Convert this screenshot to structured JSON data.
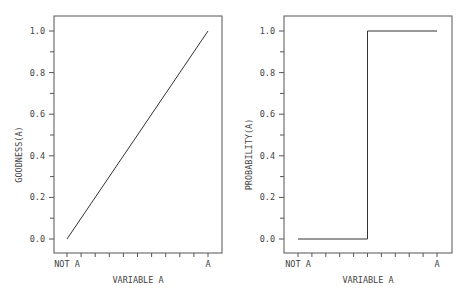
{
  "chart_data": [
    {
      "type": "line",
      "title": "",
      "xlabel": "VARIABLE A",
      "ylabel": "GOODNESS(A)",
      "x_tick_labels": {
        "start": "NOT A",
        "end": "A"
      },
      "x_minor_ticks": 11,
      "y_ticks": [
        "0.0",
        "0.2",
        "0.4",
        "0.6",
        "0.8",
        "1.0"
      ],
      "ylim": [
        0,
        1
      ],
      "grid": false,
      "series": [
        {
          "name": "goodness",
          "x": [
            0,
            1
          ],
          "y": [
            0.0,
            1.0
          ]
        }
      ]
    },
    {
      "type": "line",
      "title": "",
      "xlabel": "VARIABLE A",
      "ylabel": "PROBABILITY(A)",
      "x_tick_labels": {
        "start": "NOT A",
        "end": "A"
      },
      "x_minor_ticks": 11,
      "y_ticks": [
        "0.0",
        "0.2",
        "0.4",
        "0.6",
        "0.8",
        "1.0"
      ],
      "ylim": [
        0,
        1
      ],
      "grid": false,
      "series": [
        {
          "name": "probability",
          "x": [
            0,
            0.5,
            0.5,
            1
          ],
          "y": [
            0.0,
            0.0,
            1.0,
            1.0
          ]
        }
      ]
    }
  ],
  "panels": [
    {
      "box": {
        "left": 54,
        "top": 16,
        "right": 222,
        "bottom": 253
      },
      "x0": 67,
      "x1": 208
    },
    {
      "box": {
        "left": 284,
        "top": 16,
        "right": 452,
        "bottom": 253
      },
      "x0": 298,
      "x1": 437
    }
  ],
  "y_pixel": {
    "zero": 239,
    "one": 31
  }
}
